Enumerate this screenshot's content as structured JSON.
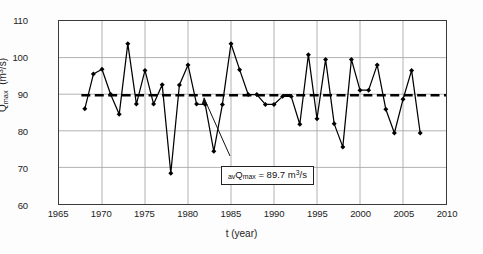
{
  "chart_data": {
    "type": "line",
    "title": "",
    "xlabel": "t (year)",
    "ylabel": "Qmax (m3/s)",
    "ylabel_parts": {
      "symbol": "Q",
      "subscript": "max",
      "units_pre": "(m",
      "units_sup": "3",
      "units_post": "/s)"
    },
    "xlim": [
      1965,
      2010
    ],
    "ylim": [
      60,
      110
    ],
    "xticks": [
      1965,
      1970,
      1975,
      1980,
      1985,
      1990,
      1995,
      2000,
      2005,
      2010
    ],
    "yticks": [
      60,
      70,
      80,
      90,
      100,
      110
    ],
    "grid": true,
    "legend": "none",
    "marker": "filled-diamond",
    "line_color": "#000000",
    "grid_color": "#a8a8a8",
    "x": [
      1968,
      1969,
      1970,
      1971,
      1972,
      1973,
      1974,
      1975,
      1976,
      1977,
      1978,
      1979,
      1980,
      1981,
      1982,
      1983,
      1984,
      1985,
      1986,
      1987,
      1988,
      1989,
      1990,
      1991,
      1992,
      1993,
      1994,
      1995,
      1996,
      1997,
      1998,
      1999,
      2000,
      2001,
      2002,
      2003,
      2004,
      2005,
      2006,
      2007
    ],
    "values": [
      86.0,
      95.5,
      96.8,
      90.0,
      84.5,
      103.8,
      87.3,
      96.5,
      87.3,
      92.6,
      68.4,
      92.5,
      98.0,
      87.3,
      87.2,
      74.4,
      87.2,
      103.8,
      96.7,
      89.9,
      89.9,
      87.2,
      87.2,
      89.4,
      89.4,
      81.8,
      100.8,
      83.3,
      99.5,
      81.9,
      75.6,
      99.5,
      91.1,
      91.1,
      98.0,
      85.9,
      79.4,
      88.6,
      96.5,
      79.4
    ],
    "mean_line": {
      "value": 89.7,
      "style": "dashed",
      "label_prefix": "av",
      "label_symbol": "Q",
      "label_subscript": "max",
      "label_middle": " = 89.7 m",
      "label_sup": "3",
      "label_suffix": "/s",
      "label_full": "avQmax = 89.7 m3/s"
    }
  }
}
